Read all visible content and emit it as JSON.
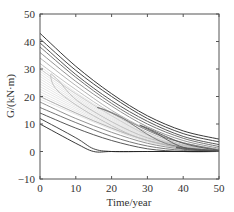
{
  "chart_data": {
    "type": "line",
    "title": "",
    "xlabel": "Time/year",
    "ylabel": "G/(kN·m)",
    "xlim": [
      0,
      50
    ],
    "ylim": [
      -10,
      50
    ],
    "xticks": [
      0,
      10,
      20,
      30,
      40,
      50
    ],
    "yticks": [
      -10,
      0,
      10,
      20,
      30,
      40,
      50
    ],
    "grid": false,
    "legend": null,
    "series_description": "Family of contour-like decay curves; darker outer curves, lighter inner curves; lowest curve reaches 0 at ~15 years and stays at 0",
    "series": [
      {
        "name": "c1",
        "color": "#222222",
        "x": [
          0,
          10,
          20,
          30,
          40,
          50
        ],
        "values": [
          43,
          31,
          21,
          13,
          7.5,
          4.5
        ]
      },
      {
        "name": "c2",
        "color": "#333333",
        "x": [
          0,
          10,
          20,
          30,
          40,
          50
        ],
        "values": [
          41,
          29.5,
          20,
          12,
          6.5,
          3.5
        ]
      },
      {
        "name": "c3",
        "color": "#444444",
        "x": [
          0,
          10,
          20,
          30,
          40,
          50
        ],
        "values": [
          39.5,
          28,
          18.5,
          11,
          5.5,
          2.5
        ]
      },
      {
        "name": "c4",
        "color": "#666666",
        "x": [
          0,
          10,
          20,
          30,
          40,
          50
        ],
        "values": [
          38,
          27,
          17.5,
          10,
          4.8,
          1.8
        ]
      },
      {
        "name": "c5",
        "color": "#888888",
        "x": [
          0,
          10,
          20,
          30,
          40,
          50
        ],
        "values": [
          36,
          25.5,
          16.5,
          9,
          4,
          1.2
        ]
      },
      {
        "name": "c6",
        "color": "#aaaaaa",
        "x": [
          0,
          10,
          20,
          30,
          40,
          50
        ],
        "values": [
          34,
          24,
          15,
          8,
          3.2,
          0.8
        ]
      },
      {
        "name": "c7",
        "color": "#bbbbbb",
        "x": [
          0,
          10,
          20,
          30,
          40,
          50
        ],
        "values": [
          32,
          22.5,
          14,
          7,
          2.5,
          0.5
        ]
      },
      {
        "name": "c8",
        "color": "#cccccc",
        "x": [
          0,
          10,
          20,
          30,
          40,
          50
        ],
        "values": [
          30,
          21,
          13,
          6,
          2,
          0.3
        ]
      },
      {
        "name": "c9",
        "color": "#aaaaaa",
        "x": [
          0,
          10,
          20,
          30,
          40,
          50
        ],
        "values": [
          20,
          14,
          8.5,
          4,
          1.2,
          0.1
        ]
      },
      {
        "name": "c10",
        "color": "#888888",
        "x": [
          0,
          10,
          20,
          30,
          40,
          50
        ],
        "values": [
          18,
          12,
          7,
          3,
          0.8,
          0
        ]
      },
      {
        "name": "c11",
        "color": "#666666",
        "x": [
          0,
          10,
          20,
          30,
          40,
          50
        ],
        "values": [
          16,
          10.5,
          5.5,
          2,
          0.4,
          0
        ]
      },
      {
        "name": "c12",
        "color": "#444444",
        "x": [
          0,
          10,
          20,
          30,
          40,
          50
        ],
        "values": [
          14,
          8.5,
          4,
          1,
          0,
          0
        ]
      },
      {
        "name": "c13",
        "color": "#333333",
        "x": [
          0,
          10,
          15,
          20,
          30,
          40,
          50
        ],
        "values": [
          12,
          5,
          1,
          0,
          0,
          0,
          0
        ]
      },
      {
        "name": "c14",
        "color": "#222222",
        "x": [
          0,
          10,
          15,
          20,
          30,
          40,
          50
        ],
        "values": [
          10,
          3,
          0,
          0,
          0,
          0,
          0
        ]
      }
    ],
    "tongues": [
      {
        "name": "t1",
        "color": "#bbbbbb",
        "x": [
          50,
          30,
          12,
          5,
          3,
          5,
          15,
          30,
          50
        ],
        "values": [
          0.6,
          5,
          17,
          26,
          28,
          22,
          13,
          4,
          0.3
        ]
      },
      {
        "name": "t2",
        "color": "#777777",
        "x": [
          50,
          35,
          20,
          16,
          22,
          35,
          50
        ],
        "values": [
          0.5,
          5,
          14,
          16,
          13,
          3,
          0.2
        ]
      },
      {
        "name": "t3",
        "color": "#555555",
        "x": [
          50,
          40,
          30,
          28,
          32,
          40,
          50
        ],
        "values": [
          0.4,
          3,
          8.5,
          9.5,
          7,
          1.5,
          0.1
        ]
      },
      {
        "name": "t4",
        "color": "#555555",
        "x": [
          50,
          42,
          38,
          42,
          50
        ],
        "values": [
          0.3,
          1,
          1.5,
          0.6,
          0.1
        ]
      }
    ]
  }
}
